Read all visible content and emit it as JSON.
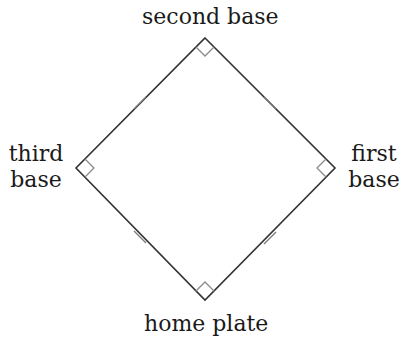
{
  "labels": {
    "second_base": "second base",
    "third_base_line1": "third",
    "third_base_line2": "base",
    "first_base_line1": "first",
    "first_base_line2": "base",
    "home_plate": "home plate"
  },
  "colors": {
    "line": "#333333",
    "right_angle": "#8a8a8a",
    "tick": "#777777",
    "text": "#1a1a1a"
  }
}
